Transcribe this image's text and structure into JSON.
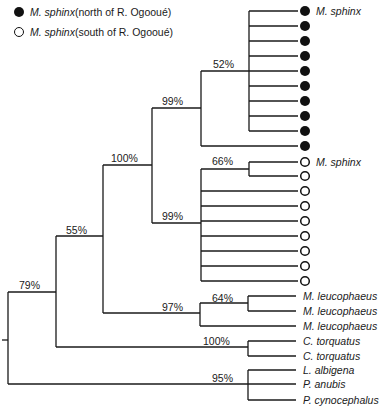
{
  "legend": [
    {
      "symbol": "filled-circle",
      "species": "M. sphinx",
      "note": " (north of R. Ogooué)"
    },
    {
      "symbol": "open-circle",
      "species": "M. sphinx",
      "note": " (south of R. Ogooué)"
    }
  ],
  "support_values": {
    "root": "79%",
    "n55": "55%",
    "n100": "100%",
    "north_clade": "99%",
    "n52": "52%",
    "south_clade": "99%",
    "n66": "66%",
    "leucophaeus_clade": "97%",
    "n64": "64%",
    "torquatus_clade": "100%",
    "outgroup_clade": "95%"
  },
  "tips": {
    "north_label": "M. sphinx",
    "south_label": "M. sphinx",
    "leuco1": "M. leucophaeus",
    "leuco2": "M. leucophaeus",
    "leuco3": "M. leucophaeus",
    "torq1": "C. torquatus",
    "torq2": "C. torquatus",
    "albigena": "L. albigena",
    "anubis": "P. anubis",
    "cyno": "P. cynocephalus"
  },
  "counts": {
    "north_tips": 10,
    "south_tips": 9
  },
  "colors": {
    "line": "#1a1a1a",
    "dot": "#111111"
  }
}
